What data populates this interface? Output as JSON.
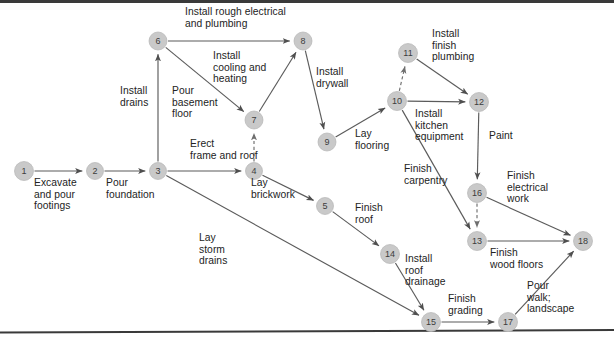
{
  "figure": {
    "type": "activity-on-arrow-network",
    "title_visible": false,
    "colors": {
      "node_fill": "#c9c9c9",
      "edge": "#5b5b5b",
      "text": "#232323",
      "rule": "#3a3a3a",
      "background": "#ffffff"
    }
  },
  "nodes": [
    {
      "id": "1",
      "label": "1",
      "x": 24,
      "y": 171,
      "r": 9.5
    },
    {
      "id": "2",
      "label": "2",
      "x": 95,
      "y": 171,
      "r": 8.5
    },
    {
      "id": "3",
      "label": "3",
      "x": 158,
      "y": 171,
      "r": 8.5
    },
    {
      "id": "4",
      "label": "4",
      "x": 254,
      "y": 171,
      "r": 8.5
    },
    {
      "id": "5",
      "label": "5",
      "x": 325,
      "y": 206,
      "r": 8.5
    },
    {
      "id": "6",
      "label": "6",
      "x": 158,
      "y": 41,
      "r": 9.0
    },
    {
      "id": "7",
      "label": "7",
      "x": 254,
      "y": 120,
      "r": 9.0
    },
    {
      "id": "8",
      "label": "8",
      "x": 303,
      "y": 41,
      "r": 9.0
    },
    {
      "id": "9",
      "label": "9",
      "x": 327,
      "y": 142,
      "r": 9.0
    },
    {
      "id": "10",
      "label": "10",
      "x": 397,
      "y": 101,
      "r": 9.5
    },
    {
      "id": "11",
      "label": "11",
      "x": 408,
      "y": 53,
      "r": 9.5
    },
    {
      "id": "12",
      "label": "12",
      "x": 479,
      "y": 102,
      "r": 9.5
    },
    {
      "id": "13",
      "label": "13",
      "x": 477,
      "y": 241,
      "r": 9.5
    },
    {
      "id": "14",
      "label": "14",
      "x": 390,
      "y": 254,
      "r": 9.5
    },
    {
      "id": "15",
      "label": "15",
      "x": 431,
      "y": 322,
      "r": 9.5
    },
    {
      "id": "16",
      "label": "16",
      "x": 477,
      "y": 193,
      "r": 9.5
    },
    {
      "id": "17",
      "label": "17",
      "x": 508,
      "y": 322,
      "r": 9.5
    },
    {
      "id": "18",
      "label": "18",
      "x": 583,
      "y": 241,
      "r": 9.5
    }
  ],
  "edges": [
    {
      "from": "1",
      "to": "2",
      "activity": "Excavate and pour footings",
      "style": "solid"
    },
    {
      "from": "2",
      "to": "3",
      "activity": "Pour foundation",
      "style": "solid"
    },
    {
      "from": "3",
      "to": "6",
      "activity": "Install drains",
      "style": "solid"
    },
    {
      "from": "3",
      "to": "4",
      "activity": "Erect frame and roof",
      "style": "solid"
    },
    {
      "from": "3",
      "to": "15",
      "activity": "Lay storm drains",
      "style": "solid"
    },
    {
      "from": "6",
      "to": "8",
      "activity": "Install rough electrical and plumbing",
      "style": "solid"
    },
    {
      "from": "6",
      "to": "7",
      "activity": "Pour basement floor",
      "style": "solid"
    },
    {
      "from": "4",
      "to": "7",
      "activity": "",
      "style": "dashed"
    },
    {
      "from": "7",
      "to": "8",
      "activity": "Install cooling and heating",
      "style": "solid"
    },
    {
      "from": "8",
      "to": "9",
      "activity": "Install drywall",
      "style": "solid"
    },
    {
      "from": "9",
      "to": "10",
      "activity": "Lay flooring",
      "style": "solid"
    },
    {
      "from": "4",
      "to": "5",
      "activity": "Lay brickwork",
      "style": "solid"
    },
    {
      "from": "5",
      "to": "14",
      "activity": "Finish roof",
      "style": "solid"
    },
    {
      "from": "14",
      "to": "15",
      "activity": "Install roof drainage",
      "style": "solid"
    },
    {
      "from": "10",
      "to": "11",
      "activity": "",
      "style": "dashed"
    },
    {
      "from": "11",
      "to": "12",
      "activity": "Install finish plumbing",
      "style": "solid"
    },
    {
      "from": "10",
      "to": "12",
      "activity": "Install kitchen equipment",
      "style": "solid"
    },
    {
      "from": "10",
      "to": "13",
      "activity": "Finish carpentry",
      "style": "solid"
    },
    {
      "from": "12",
      "to": "16",
      "activity": "Paint",
      "style": "solid"
    },
    {
      "from": "16",
      "to": "13",
      "activity": "",
      "style": "dashed"
    },
    {
      "from": "16",
      "to": "18",
      "activity": "Finish electrical work",
      "style": "solid"
    },
    {
      "from": "13",
      "to": "18",
      "activity": "Finish wood floors",
      "style": "solid"
    },
    {
      "from": "15",
      "to": "17",
      "activity": "Finish grading",
      "style": "solid"
    },
    {
      "from": "17",
      "to": "18",
      "activity": "Pour walk; landscape",
      "style": "solid"
    }
  ],
  "labels": [
    {
      "key": "install_rough_electrical",
      "lines": "Install rough electrical\nand plumbing",
      "x": 185,
      "y": 6,
      "align": "left"
    },
    {
      "key": "install_drains",
      "lines": "Install\ndrains",
      "x": 120,
      "y": 85,
      "align": "left"
    },
    {
      "key": "pour_basement_floor",
      "lines": "Pour\nbasement\nfloor",
      "x": 172,
      "y": 85,
      "align": "left"
    },
    {
      "key": "install_cooling_heating",
      "lines": "Install\ncooling and\nheating",
      "x": 213,
      "y": 50,
      "align": "left"
    },
    {
      "key": "erect_frame_and_roof",
      "lines": "Erect\nframe and roof",
      "x": 190,
      "y": 138,
      "align": "left"
    },
    {
      "key": "install_drywall",
      "lines": "Install\ndrywall",
      "x": 316,
      "y": 66,
      "align": "left"
    },
    {
      "key": "excavate_and_pour",
      "lines": "Excavate\nand pour\nfootings",
      "x": 34,
      "y": 177,
      "align": "left"
    },
    {
      "key": "pour_foundation",
      "lines": "Pour\nfoundation",
      "x": 106,
      "y": 177,
      "align": "left"
    },
    {
      "key": "lay_brickwork",
      "lines": "Lay\nbrickwork",
      "x": 251,
      "y": 177,
      "align": "left"
    },
    {
      "key": "lay_storm_drains",
      "lines": "Lay\nstorm\ndrains",
      "x": 199,
      "y": 232,
      "align": "left"
    },
    {
      "key": "lay_flooring",
      "lines": "Lay\nflooring",
      "x": 355,
      "y": 128,
      "align": "left"
    },
    {
      "key": "install_finish_plumbing",
      "lines": "Install\nfinish\nplumbing",
      "x": 432,
      "y": 28,
      "align": "left"
    },
    {
      "key": "install_kitchen_equipment",
      "lines": "Install\nkitchen\nequipment",
      "x": 415,
      "y": 108,
      "align": "left"
    },
    {
      "key": "paint",
      "lines": "Paint",
      "x": 489,
      "y": 130,
      "align": "left"
    },
    {
      "key": "finish_carpentry",
      "lines": "Finish\ncarpentry",
      "x": 404,
      "y": 163,
      "align": "left"
    },
    {
      "key": "finish_roof",
      "lines": "Finish\nroof",
      "x": 355,
      "y": 202,
      "align": "left"
    },
    {
      "key": "finish_electrical_work",
      "lines": "Finish\nelectrical\nwork",
      "x": 507,
      "y": 170,
      "align": "left"
    },
    {
      "key": "install_roof_drainage",
      "lines": "Install\nroof\ndrainage",
      "x": 405,
      "y": 253,
      "align": "left"
    },
    {
      "key": "finish_wood_floors",
      "lines": "Finish\nwood floors",
      "x": 490,
      "y": 247,
      "align": "left"
    },
    {
      "key": "finish_grading",
      "lines": "Finish\ngrading",
      "x": 448,
      "y": 293,
      "align": "left"
    },
    {
      "key": "pour_walk_landscape",
      "lines": "Pour\nwalk;\nlandscape",
      "x": 527,
      "y": 280,
      "align": "left"
    }
  ],
  "rules": [
    {
      "key": "top-rule",
      "x1": 0,
      "y1": 1.5,
      "x2": 614,
      "y2": 1.5,
      "width": 3.0
    },
    {
      "key": "bottom-rule",
      "x1": 0,
      "y1": 332.5,
      "x2": 614,
      "y2": 330.0,
      "width": 2.0
    }
  ]
}
